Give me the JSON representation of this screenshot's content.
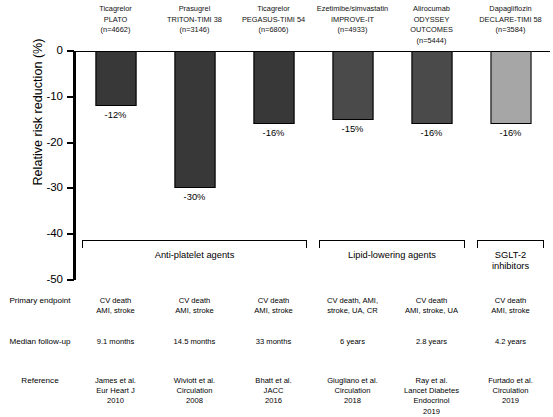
{
  "chart_data": {
    "type": "bar",
    "title": "",
    "xlabel": "",
    "ylabel": "Relative risk reduction (%)",
    "ylim": [
      -50,
      0
    ],
    "yticks": [
      "0",
      "-10",
      "-20",
      "-30",
      "-40",
      "-50"
    ],
    "ytick_values": [
      0,
      -10,
      -20,
      -30,
      -40,
      -50
    ],
    "grid": false,
    "legend": "none",
    "categories": [
      "Ticagrelor PLATO",
      "Prasugrel TRITON-TIMI 38",
      "Ticagrelor PEGASUS-TIMI 54",
      "Ezetimibe/simvastatin IMPROVE-IT",
      "Alirocumab ODYSSEY OUTCOMES",
      "Dapagliflozin DECLARE-TIMI 58"
    ],
    "values": [
      -12,
      -30,
      -16,
      -15,
      -16,
      -16
    ],
    "value_labels": [
      "-12%",
      "-30%",
      "-16%",
      "-15%",
      "-16%",
      "-16%"
    ],
    "bar_colors": [
      "#383838",
      "#383838",
      "#383838",
      "#4a4a4a",
      "#4a4a4a",
      "#a6a6a6"
    ]
  },
  "columns": [
    {
      "drug": "Ticagrelor",
      "trial": "PLATO",
      "n": "(n=4662)",
      "value": -12,
      "value_label": "-12%",
      "color": "#383838",
      "endpoint": [
        "CV death",
        "AMI, stroke"
      ],
      "followup": [
        "9.1 months"
      ],
      "reference": [
        "James et al.",
        "Eur Heart J",
        "2010"
      ]
    },
    {
      "drug": "Prasugrel",
      "trial": "TRITON-TIMI 38",
      "n": "(n=3146)",
      "value": -30,
      "value_label": "-30%",
      "color": "#383838",
      "endpoint": [
        "CV death",
        "AMI, stroke"
      ],
      "followup": [
        "14.5 months"
      ],
      "reference": [
        "Wiviott et al.",
        "Circulation",
        "2008"
      ]
    },
    {
      "drug": "Ticagrelor",
      "trial": "PEGASUS-TIMI 54",
      "n": "(n=6806)",
      "value": -16,
      "value_label": "-16%",
      "color": "#383838",
      "endpoint": [
        "CV death",
        "AMI, stroke"
      ],
      "followup": [
        "33 months"
      ],
      "reference": [
        "Bhatt et al.",
        "JACC",
        "2016"
      ]
    },
    {
      "drug": "Ezetimibe/simvastatin",
      "trial": "IMPROVE-IT",
      "n": "(n=4933)",
      "value": -15,
      "value_label": "-15%",
      "color": "#4a4a4a",
      "endpoint": [
        "CV death, AMI,",
        "stroke, UA, CR"
      ],
      "followup": [
        "6 years"
      ],
      "reference": [
        "Giugliano et al.",
        "Circulation",
        "2018"
      ]
    },
    {
      "drug": "Alirocumab",
      "trial": "ODYSSEY OUTCOMES",
      "n": "(n=5444)",
      "value": -16,
      "value_label": "-16%",
      "color": "#4a4a4a",
      "endpoint": [
        "CV death",
        "AMI, stroke, UA"
      ],
      "followup": [
        "2.8 years"
      ],
      "reference": [
        "Ray et al.",
        "Lancet Diabetes Endocrinol",
        "2019"
      ]
    },
    {
      "drug": "Dapagliflozin",
      "trial": "DECLARE-TIMI 58",
      "n": "(n=3584)",
      "value": -16,
      "value_label": "-16%",
      "color": "#a6a6a6",
      "endpoint": [
        "CV death",
        "AMI, stroke"
      ],
      "followup": [
        "4.2 years"
      ],
      "reference": [
        "Furtado et al.",
        "Circulation",
        "2019"
      ]
    }
  ],
  "groups": [
    {
      "name": "Anti-platelet agents",
      "start": 0,
      "end": 2
    },
    {
      "name": "Lipid-lowering agents",
      "start": 3,
      "end": 4
    },
    {
      "name": "SGLT-2 inhibitors",
      "start": 5,
      "end": 5
    }
  ],
  "row_labels": {
    "endpoint": [
      "Primary",
      "endpoint"
    ],
    "followup": [
      "Median",
      "follow-up"
    ],
    "reference": [
      "Reference"
    ]
  },
  "axis": {
    "ylabel": "Relative risk reduction (%)",
    "ticks": [
      "0",
      "-10",
      "-20",
      "-30",
      "-40",
      "-50"
    ]
  }
}
